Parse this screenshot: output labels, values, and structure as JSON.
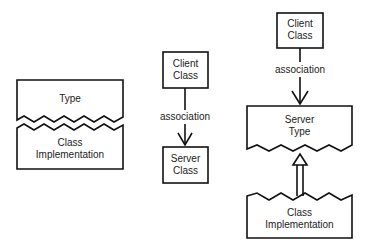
{
  "diagram_left": {
    "top_label": "Type",
    "bottom_label_line1": "Class",
    "bottom_label_line2": "Implementation"
  },
  "diagram_middle": {
    "client_line1": "Client",
    "client_line2": "Class",
    "association": "association",
    "server_line1": "Server",
    "server_line2": "Class"
  },
  "diagram_right": {
    "client_line1": "Client",
    "client_line2": "Class",
    "association": "association",
    "server_line1": "Server",
    "server_line2": "Type",
    "impl_line1": "Class",
    "impl_line2": "Implementation"
  },
  "colors": {
    "stroke": "#111111",
    "background": "#ffffff"
  }
}
